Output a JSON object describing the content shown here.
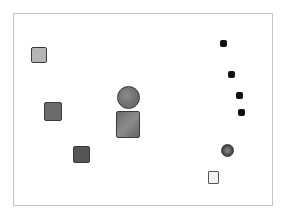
{
  "canvas": {
    "width": 288,
    "height": 220,
    "background": "#ffffff",
    "frame": {
      "left": 13,
      "top": 13,
      "width": 260,
      "height": 193,
      "border_color": "#c4c4c4"
    }
  },
  "shapes": [
    {
      "id": "square-light",
      "type": "square",
      "x": 31,
      "y": 47,
      "w": 16,
      "h": 16,
      "fill": "#b5b5b5"
    },
    {
      "id": "square-dark-1",
      "type": "square",
      "x": 44,
      "y": 102,
      "w": 18,
      "h": 19,
      "fill": "#6b6b6b"
    },
    {
      "id": "circle-large",
      "type": "circle",
      "x": 117,
      "y": 86,
      "w": 23,
      "h": 23,
      "fill": "#707070"
    },
    {
      "id": "square-large",
      "type": "square",
      "x": 116,
      "y": 111,
      "w": 24,
      "h": 27,
      "fill": "#787878"
    },
    {
      "id": "square-dark-2",
      "type": "square",
      "x": 73,
      "y": 146,
      "w": 17,
      "h": 17,
      "fill": "#555555"
    },
    {
      "id": "dot-1",
      "type": "dot",
      "x": 220,
      "y": 40,
      "w": 7,
      "h": 7,
      "fill": "#111111"
    },
    {
      "id": "dot-2",
      "type": "dot",
      "x": 228,
      "y": 71,
      "w": 7,
      "h": 7,
      "fill": "#111111"
    },
    {
      "id": "dot-3",
      "type": "dot",
      "x": 236,
      "y": 92,
      "w": 7,
      "h": 7,
      "fill": "#111111"
    },
    {
      "id": "dot-4",
      "type": "dot",
      "x": 238,
      "y": 109,
      "w": 7,
      "h": 7,
      "fill": "#111111"
    },
    {
      "id": "circle-small",
      "type": "circle",
      "x": 221,
      "y": 144,
      "w": 13,
      "h": 13,
      "fill": "#5a5a5a"
    },
    {
      "id": "square-outline",
      "type": "outline-square",
      "x": 208,
      "y": 171,
      "w": 11,
      "h": 13,
      "fill": "#f2f2f2"
    }
  ]
}
